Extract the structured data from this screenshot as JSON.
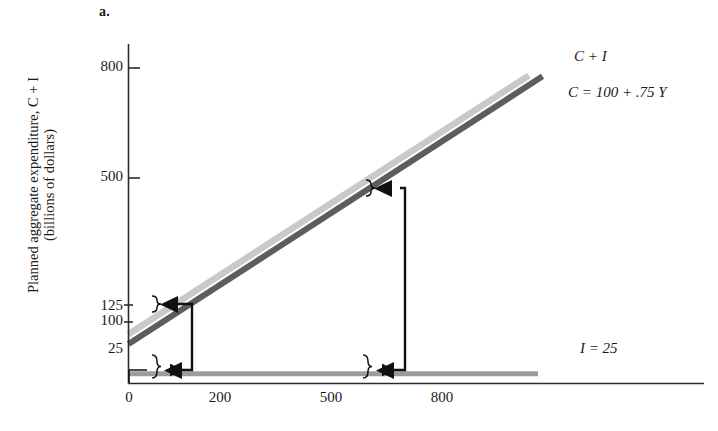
{
  "figure": {
    "panel_label": "a.",
    "y_axis_title_line1": "Planned aggregate expenditure, C + I",
    "y_axis_title_line2": "(billions of dollars)"
  },
  "labels": {
    "c_plus_i": "C + I",
    "c_function": "C = 100 + .75 Y",
    "investment": "I = 25"
  },
  "colors": {
    "c_plus_i_line": "#c9c9c9",
    "c_line": "#5d5d5d",
    "i_line": "#9c9c9c",
    "annotation": "#111111",
    "axis": "#2b2b2b"
  },
  "chart_data": {
    "type": "line",
    "title": "",
    "subtitle": "",
    "xlabel": "",
    "ylabel": "Planned aggregate expenditure, C + I (billions of dollars)",
    "xlim": [
      0,
      900
    ],
    "ylim": [
      0,
      880
    ],
    "grid": false,
    "legend": "inline-right-labels",
    "x_ticks": [
      0,
      200,
      500,
      800
    ],
    "x_tick_labels": [
      "0",
      "200",
      "500",
      "800"
    ],
    "y_ticks": [
      25,
      100,
      125,
      500,
      800
    ],
    "y_tick_labels": [
      "25",
      "100",
      "125",
      "500",
      "800"
    ],
    "series": [
      {
        "name": "C + I",
        "label": "C + I",
        "color": "#c9c9c9",
        "intercept": 125,
        "slope": 0.75,
        "x": [
          0,
          875
        ],
        "values": [
          125,
          781
        ]
      },
      {
        "name": "C",
        "label": "C = 100 + .75 Y",
        "color": "#5d5d5d",
        "intercept": 100,
        "slope": 0.75,
        "x": [
          0,
          905
        ],
        "values": [
          100,
          779
        ]
      },
      {
        "name": "I",
        "label": "I = 25",
        "color": "#9c9c9c",
        "intercept": 25,
        "slope": 0,
        "x": [
          0,
          895
        ],
        "values": [
          25,
          25
        ]
      }
    ],
    "annotations": [
      {
        "name": "vertical-multiplier-connector-left",
        "type": "bracket-arrows",
        "x": 100,
        "from_y": 25,
        "to_y": 112,
        "note": "I = 25 gap mapped up to the 25-unit vertical gap between C and C + I"
      },
      {
        "name": "vertical-multiplier-connector-right",
        "type": "bracket-arrows",
        "x": 500,
        "from_y": 25,
        "to_y": 480,
        "note": "I = 25 gap mapped up to the 25-unit vertical gap between C and C + I"
      }
    ]
  }
}
